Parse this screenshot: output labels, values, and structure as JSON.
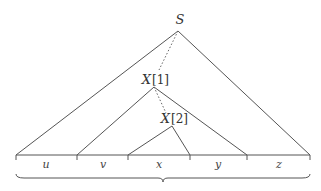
{
  "diagram": {
    "nodes": {
      "root": {
        "label": "S"
      },
      "x1": {
        "label": "X",
        "index": "[1]"
      },
      "x2": {
        "label": "X",
        "index": "[2]"
      }
    },
    "segments": [
      {
        "label": "u"
      },
      {
        "label": "v"
      },
      {
        "label": "x"
      },
      {
        "label": "y"
      },
      {
        "label": "z"
      }
    ],
    "colors": {
      "line": "#555555",
      "text": "#333333",
      "background": "#ffffff"
    }
  }
}
